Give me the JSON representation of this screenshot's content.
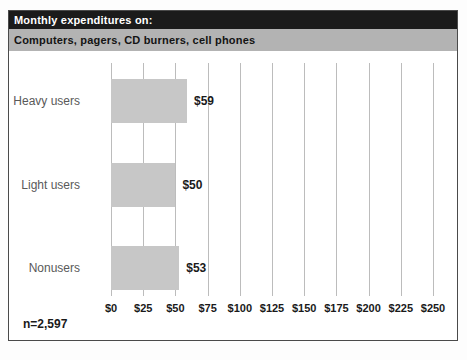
{
  "header": {
    "title": "Monthly expenditures on:",
    "subtitle": "Computers, pagers, CD burners, cell phones"
  },
  "footnote": "n=2,597",
  "colors": {
    "title_bar_bg": "#1b1b1b",
    "title_text": "#ffffff",
    "subtitle_bar_bg": "#b3b3b3",
    "bar_fill": "#c7c7c7",
    "gridline": "#bcbcbc",
    "border": "#4a4a4a",
    "category_text": "#595959",
    "value_text": "#1a1a1a"
  },
  "chart_data": {
    "type": "bar",
    "orientation": "horizontal",
    "title": "Monthly expenditures on:",
    "subtitle": "Computers, pagers, CD burners, cell phones",
    "categories": [
      "Heavy users",
      "Light users",
      "Nonusers"
    ],
    "values": [
      59,
      50,
      53
    ],
    "value_labels": [
      "$59",
      "$50",
      "$53"
    ],
    "x_tick_labels": [
      "$0",
      "$25",
      "$50",
      "$75",
      "$100",
      "$125",
      "$150",
      "$175",
      "$200",
      "$225",
      "$250"
    ],
    "x_tick_values": [
      0,
      25,
      50,
      75,
      100,
      125,
      150,
      175,
      200,
      225,
      250
    ],
    "xlim": [
      0,
      250
    ],
    "grid": "vertical",
    "legend": "none",
    "sample_note": "n=2,597"
  }
}
